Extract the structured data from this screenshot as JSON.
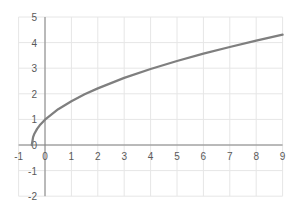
{
  "chart_data": {
    "type": "line",
    "title": "",
    "xlabel": "",
    "ylabel": "",
    "xlim": [
      -1,
      9
    ],
    "ylim": [
      -2,
      5
    ],
    "grid": true,
    "legend": null,
    "x_ticks": [
      "-1",
      "0",
      "1",
      "2",
      "3",
      "4",
      "5",
      "6",
      "7",
      "8",
      "9"
    ],
    "y_ticks": [
      "-2",
      "-1",
      "0",
      "1",
      "2",
      "3",
      "4",
      "5"
    ],
    "series": [
      {
        "name": "curve",
        "color": "#7f7f7f",
        "x": [
          -0.5,
          -0.45,
          -0.4,
          -0.3,
          -0.2,
          0,
          0.5,
          1,
          1.5,
          2,
          3,
          4,
          5,
          6,
          7,
          8,
          9
        ],
        "y": [
          0,
          0.31,
          0.44,
          0.63,
          0.77,
          0.99,
          1.4,
          1.71,
          1.98,
          2.21,
          2.62,
          2.97,
          3.28,
          3.57,
          3.83,
          4.08,
          4.31
        ]
      }
    ]
  },
  "colors": {
    "grid": "#e6e6e6",
    "axis": "#808080",
    "line": "#7f7f7f"
  }
}
